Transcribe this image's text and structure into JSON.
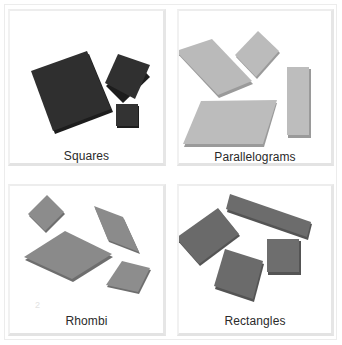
{
  "panels": {
    "squares": {
      "label": "Squares",
      "fill": "#2f2f2f",
      "edge": "#1c1c1c",
      "shape_count": 3
    },
    "parallelograms": {
      "label": "Parallelograms",
      "fill": "#b9b9b9",
      "edge": "#9a9a9a",
      "shape_count": 4
    },
    "rhombi": {
      "label": "Rhombi",
      "fill": "#8b8b8b",
      "edge": "#6e6e6e",
      "shape_count": 4
    },
    "rectangles": {
      "label": "Rectangles",
      "fill": "#6c6c6c",
      "edge": "#545454",
      "shape_count": 4
    }
  },
  "faint_mark": "2"
}
